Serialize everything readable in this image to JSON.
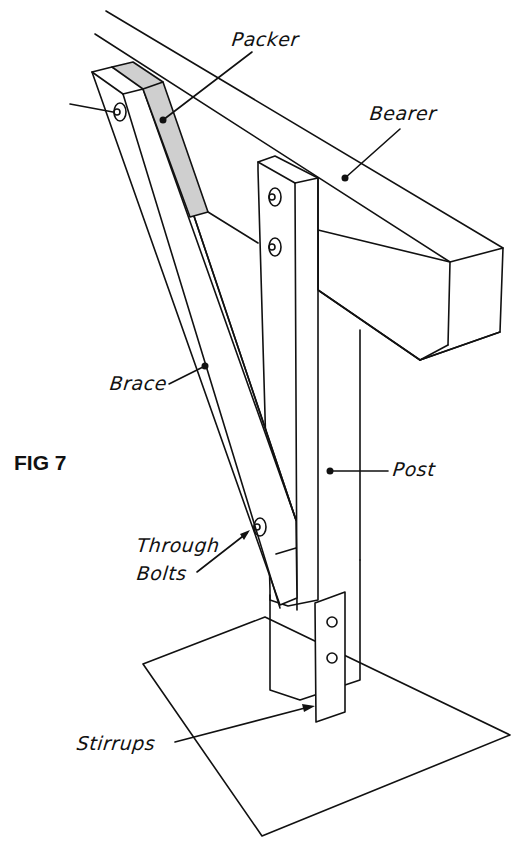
{
  "figure": {
    "title": "FIG 7"
  },
  "labels": {
    "packer": "Packer",
    "bearer": "Bearer",
    "brace": "Brace",
    "post": "Post",
    "through_bolts_line1": "Through",
    "through_bolts_line2": "Bolts",
    "stirrups": "Stirrups"
  },
  "colors": {
    "line": "#111111",
    "packer_fill": "#cfcfcf",
    "background": "#ffffff"
  }
}
